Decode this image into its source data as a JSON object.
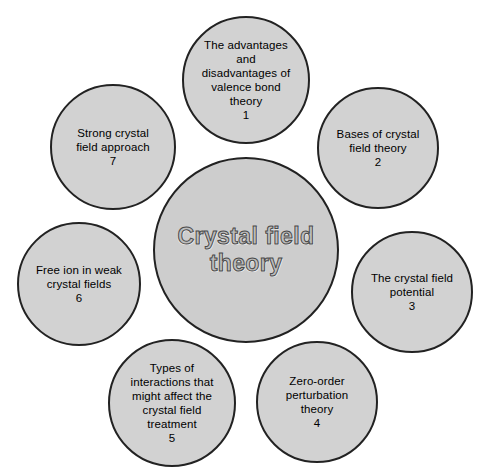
{
  "diagram": {
    "type": "radial-hub-and-spoke",
    "background_color": "#ffffff",
    "node_fill_color": "#d2d2d2",
    "node_border_color": "#222222",
    "text_color": "#000000",
    "center": {
      "label": "Crystal field\ntheory",
      "cx": 246,
      "cy": 250,
      "diameter": 186
    },
    "nodes": [
      {
        "number": "1",
        "label": "The advantages\nand\ndisadvantages of\nvalence bond\ntheory\n1",
        "cx": 246,
        "cy": 80,
        "diameter": 128
      },
      {
        "number": "2",
        "label": "Bases of crystal\nfield theory\n2",
        "cx": 378,
        "cy": 148,
        "diameter": 122
      },
      {
        "number": "3",
        "label": "The crystal field\npotential\n3",
        "cx": 412,
        "cy": 292,
        "diameter": 122
      },
      {
        "number": "4",
        "label": "Zero-order\nperturbation\ntheory\n4",
        "cx": 317,
        "cy": 402,
        "diameter": 122
      },
      {
        "number": "5",
        "label": "Types of\ninteractions that\nmight affect the\ncrystal field\ntreatment\n5",
        "cx": 172,
        "cy": 403,
        "diameter": 128
      },
      {
        "number": "6",
        "label": "Free ion in weak\ncrystal fields\n6",
        "cx": 79,
        "cy": 284,
        "diameter": 124
      },
      {
        "number": "7",
        "label": "Strong crystal\nfield approach\n7",
        "cx": 113,
        "cy": 147,
        "diameter": 126
      }
    ]
  }
}
